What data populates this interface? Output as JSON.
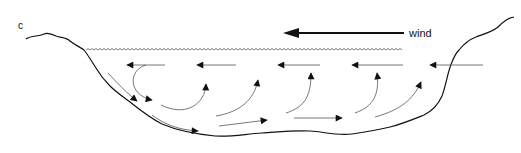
{
  "figure": {
    "panel_label": "c",
    "wind_label": "wind"
  },
  "colors": {
    "line": "#111111",
    "flow": "#555555",
    "background": "#ffffff"
  },
  "elements": {
    "wind_arrow": {
      "direction": "left"
    },
    "surface_arrows": {
      "count": 5,
      "direction": "left"
    },
    "upwelling_arrows": {
      "count": 5,
      "direction": "up"
    },
    "bottom_arrows": {
      "count": 4,
      "direction": "right"
    },
    "left_downwelling_arrows": {
      "count": 2,
      "direction": "down-right"
    }
  }
}
